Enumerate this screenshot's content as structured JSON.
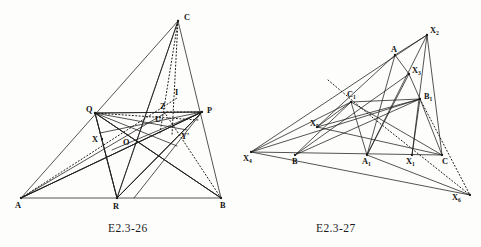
{
  "page": {
    "background": "#fdfdfb",
    "ink": "#1b1b1b",
    "width": 481,
    "height": 247
  },
  "figures": [
    {
      "id": "E2.3-26",
      "caption": "E2.3-26",
      "description": "Triangle ABC with cevians through R, P, Q and interior points O, U, X, Y', Z, I",
      "points": [
        {
          "name": "A",
          "label": "A",
          "x": 21,
          "y": 198,
          "lx": 15,
          "ly": 208,
          "dot": true
        },
        {
          "name": "B",
          "label": "B",
          "x": 221,
          "y": 198,
          "lx": 220,
          "ly": 208,
          "dot": true
        },
        {
          "name": "C",
          "label": "C",
          "x": 178,
          "y": 21,
          "lx": 184,
          "ly": 20,
          "dot": true
        },
        {
          "name": "R",
          "label": "R",
          "x": 117,
          "y": 198,
          "lx": 113,
          "ly": 209,
          "dot": true
        },
        {
          "name": "P",
          "label": "P",
          "x": 202,
          "y": 112,
          "lx": 207,
          "ly": 113,
          "dot": true
        },
        {
          "name": "Q",
          "label": "Q",
          "x": 95,
          "y": 113,
          "lx": 86,
          "ly": 112,
          "dot": true
        },
        {
          "name": "X",
          "label": "X",
          "x": 102,
          "y": 139,
          "lx": 92,
          "ly": 142,
          "dot": true
        },
        {
          "name": "O",
          "label": "O",
          "x": 133,
          "y": 142,
          "lx": 123,
          "ly": 145,
          "dot": false
        },
        {
          "name": "U",
          "label": "U",
          "x": 160,
          "y": 124,
          "lx": 155,
          "ly": 122,
          "dot": false
        },
        {
          "name": "Z",
          "label": "Z",
          "x": 167,
          "y": 112,
          "lx": 160,
          "ly": 109,
          "dot": false
        },
        {
          "name": "I",
          "label": "I",
          "x": 172,
          "y": 98,
          "lx": 175,
          "ly": 95,
          "dot": false
        },
        {
          "name": "Yp",
          "label": "Y'",
          "x": 177,
          "y": 128,
          "lx": 181,
          "ly": 139,
          "dot": false
        }
      ],
      "solid_segments": [
        [
          "A",
          "B"
        ],
        [
          "A",
          "C"
        ],
        [
          "B",
          "C"
        ],
        [
          "A",
          "P"
        ],
        [
          "B",
          "Q"
        ],
        [
          "C",
          "R"
        ],
        [
          "Q",
          "P"
        ],
        [
          "Q",
          "R"
        ],
        [
          "P",
          "R"
        ],
        [
          "Q",
          "B"
        ],
        [
          "P",
          "A"
        ],
        [
          "R",
          "P"
        ],
        [
          "R",
          "Q"
        ]
      ],
      "extra_solid": [
        {
          "from": [
            95,
            113
          ],
          "to": [
            221,
            198
          ]
        },
        {
          "from": [
            202,
            112
          ],
          "to": [
            21,
            198
          ]
        },
        {
          "from": [
            117,
            198
          ],
          "to": [
            202,
            112
          ]
        },
        {
          "from": [
            117,
            198
          ],
          "to": [
            95,
            113
          ]
        },
        {
          "from": [
            95,
            113
          ],
          "to": [
            202,
            112
          ]
        },
        {
          "from": [
            117,
            198
          ],
          "to": [
            178,
            21
          ]
        },
        {
          "from": [
            95,
            113
          ],
          "to": [
            187,
            130
          ]
        },
        {
          "from": [
            202,
            112
          ],
          "to": [
            100,
            133
          ]
        },
        {
          "from": [
            202,
            112
          ],
          "to": [
            112,
            150
          ]
        },
        {
          "from": [
            95,
            113
          ],
          "to": [
            177,
            146
          ]
        },
        {
          "from": [
            134,
            198
          ],
          "to": [
            202,
            112
          ]
        },
        {
          "from": [
            21,
            198
          ],
          "to": [
            167,
            112
          ]
        }
      ],
      "dotted_segments": [
        {
          "from": [
            178,
            21
          ],
          "to": [
            160,
            133
          ]
        },
        {
          "from": [
            178,
            21
          ],
          "to": [
            172,
            135
          ]
        },
        {
          "from": [
            21,
            198
          ],
          "to": [
            177,
            98
          ]
        },
        {
          "from": [
            221,
            198
          ],
          "to": [
            163,
            110
          ]
        },
        {
          "from": [
            95,
            113
          ],
          "to": [
            198,
            120
          ]
        },
        {
          "from": [
            167,
            112
          ],
          "to": [
            202,
            112
          ]
        }
      ]
    },
    {
      "id": "E2.3-27",
      "caption": "E2.3-27",
      "description": "Triangle with points A, B, C, A1, B1, C1 and perspective points X1 through X6 on a line",
      "points": [
        {
          "name": "X4",
          "label": "X",
          "sub": "4",
          "x": 251,
          "y": 152,
          "lx": 243,
          "ly": 161,
          "dot": true
        },
        {
          "name": "B",
          "label": "B",
          "sub": "",
          "x": 295,
          "y": 155,
          "lx": 292,
          "ly": 164,
          "dot": true
        },
        {
          "name": "A1",
          "label": "A",
          "sub": "1",
          "x": 367,
          "y": 155,
          "lx": 362,
          "ly": 164,
          "dot": true
        },
        {
          "name": "X1",
          "label": "X",
          "sub": "1",
          "x": 412,
          "y": 155,
          "lx": 406,
          "ly": 164,
          "dot": true
        },
        {
          "name": "C",
          "label": "C",
          "sub": "",
          "x": 442,
          "y": 155,
          "lx": 442,
          "ly": 164,
          "dot": true
        },
        {
          "name": "X2",
          "label": "X",
          "sub": "2",
          "x": 427,
          "y": 35,
          "lx": 430,
          "ly": 33,
          "dot": true
        },
        {
          "name": "A",
          "label": "A",
          "sub": "",
          "x": 395,
          "y": 55,
          "lx": 391,
          "ly": 52,
          "dot": true
        },
        {
          "name": "X3",
          "label": "X",
          "sub": "3",
          "x": 409,
          "y": 74,
          "lx": 412,
          "ly": 73,
          "dot": true
        },
        {
          "name": "B1",
          "label": "B",
          "sub": "1",
          "x": 420,
          "y": 99,
          "lx": 424,
          "ly": 99,
          "dot": true
        },
        {
          "name": "C1",
          "label": "C",
          "sub": "1",
          "x": 351,
          "y": 102,
          "lx": 347,
          "ly": 97,
          "dot": true
        },
        {
          "name": "X5",
          "label": "X",
          "sub": "5",
          "x": 317,
          "y": 127,
          "lx": 310,
          "ly": 126,
          "dot": true
        },
        {
          "name": "X6",
          "label": "X",
          "sub": "6",
          "x": 470,
          "y": 195,
          "lx": 452,
          "ly": 200,
          "dot": true
        }
      ],
      "solid_segments": [
        [
          "X4",
          "C"
        ],
        [
          "X4",
          "X2"
        ],
        [
          "X4",
          "B1"
        ],
        [
          "X4",
          "C1"
        ],
        [
          "B",
          "C1"
        ],
        [
          "B",
          "B1"
        ],
        [
          "B",
          "X3"
        ],
        [
          "A1",
          "A"
        ],
        [
          "A1",
          "X2"
        ],
        [
          "A1",
          "C1"
        ],
        [
          "A1",
          "X6"
        ],
        [
          "X1",
          "X2"
        ],
        [
          "X1",
          "B1"
        ],
        [
          "C",
          "X2"
        ],
        [
          "C",
          "B1"
        ],
        [
          "C",
          "C1"
        ],
        [
          "X2",
          "A"
        ],
        [
          "A",
          "X3"
        ],
        [
          "A",
          "X5"
        ],
        [
          "X3",
          "B1"
        ],
        [
          "X3",
          "A1"
        ],
        [
          "C1",
          "B1"
        ],
        [
          "C1",
          "X5"
        ],
        [
          "X5",
          "B1"
        ],
        [
          "X5",
          "C"
        ],
        [
          "X4",
          "X6"
        ]
      ],
      "dotted_segments": [
        {
          "from": [
            328,
            80
          ],
          "to": [
            372,
            117
          ]
        },
        {
          "from": [
            372,
            117
          ],
          "to": [
            470,
            195
          ]
        },
        {
          "from": [
            420,
            99
          ],
          "to": [
            470,
            195
          ]
        }
      ]
    }
  ]
}
